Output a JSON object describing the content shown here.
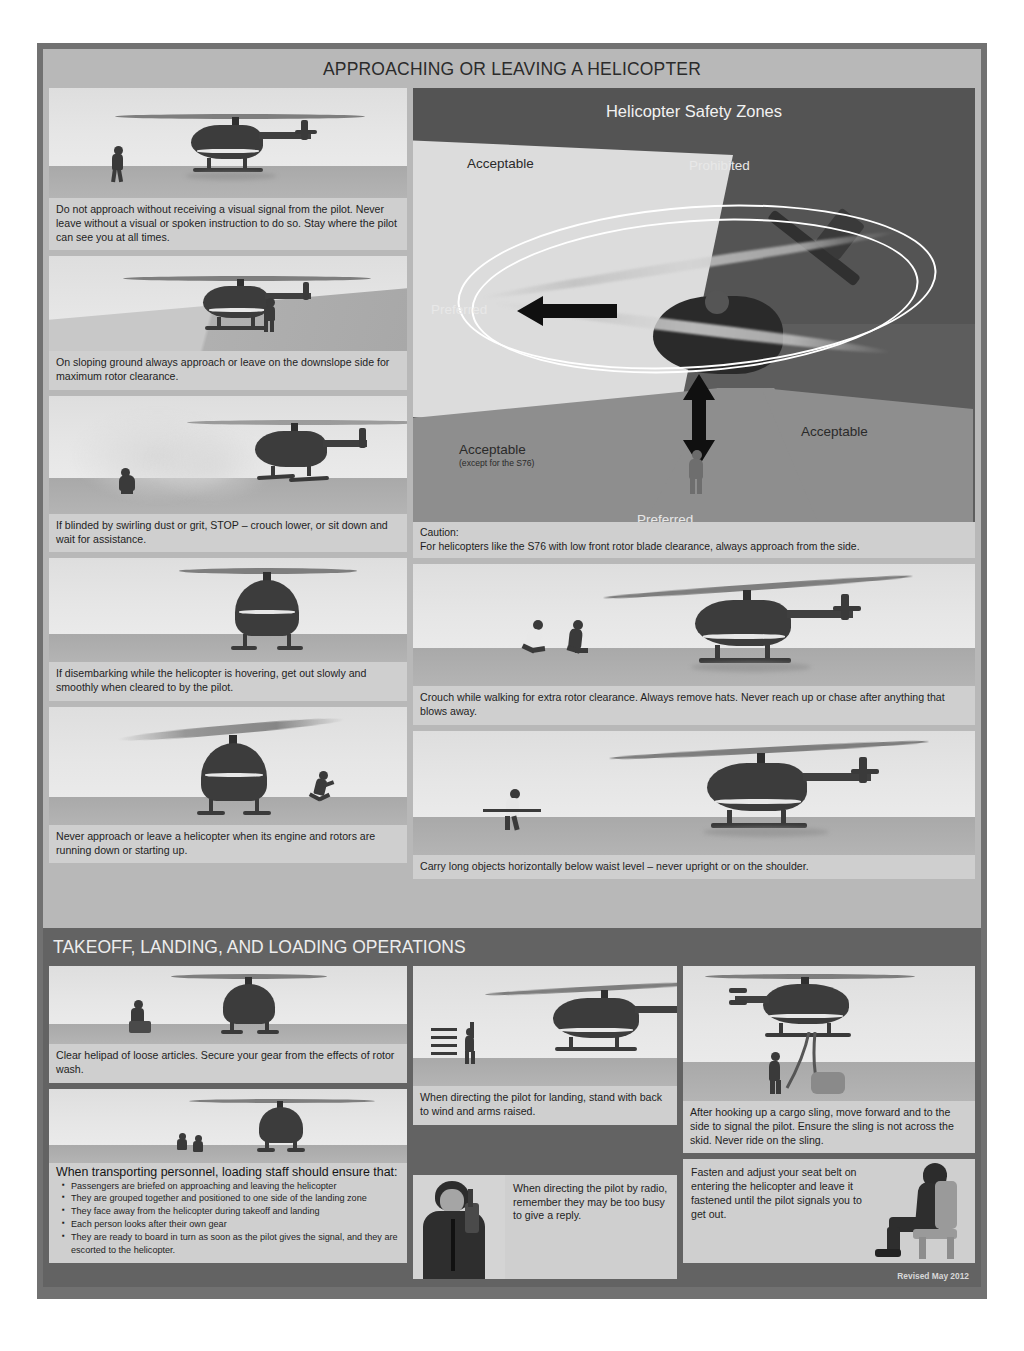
{
  "poster": {
    "revised": "Revised May 2012"
  },
  "section_approach": {
    "title": "APPROACHING OR LEAVING A HELICOPTER",
    "left_panels": [
      {
        "caption": "Do not approach without receiving a visual signal from the pilot. Never leave without a visual or spoken instruction to do so. Stay where the pilot can see you at all times."
      },
      {
        "caption": "On sloping ground always approach or leave on the downslope side for maximum rotor clearance."
      },
      {
        "caption": "If blinded by swirling dust or grit, STOP – crouch lower, or sit down and wait for assistance."
      },
      {
        "caption": "If disembarking while the helicopter is hovering, get out slowly and smoothly when cleared to by the pilot."
      },
      {
        "caption": "Never approach or leave a helicopter when its engine and rotors are running down or starting up."
      }
    ],
    "right_panels": [
      {
        "caption": "Crouch while walking for extra rotor clearance. Always remove hats. Never reach up or chase after anything that blows away."
      },
      {
        "caption": "Carry long objects horizontally below waist level – never upright or on the shoulder."
      }
    ]
  },
  "safety_zones": {
    "title": "Helicopter Safety Zones",
    "labels": {
      "acceptable_top_left": "Acceptable",
      "prohibited": "Prohibited",
      "preferred_left": "Preferred",
      "acceptable_bottom_left": "Acceptable",
      "acceptable_bottom_left_sub": "(except for the S76)",
      "acceptable_right": "Acceptable",
      "preferred_bottom": "Preferred"
    },
    "caution_label": "Caution:",
    "caution_text": "For helicopters like the S76 with low front rotor blade clearance, always approach from the side."
  },
  "section_takeoff": {
    "title": "TAKEOFF, LANDING, AND LOADING OPERATIONS",
    "panel_helipad": {
      "caption": "Clear helipad of loose articles. Secure your gear from the effects of rotor wash."
    },
    "panel_loading": {
      "heading": "When transporting personnel, loading staff should ensure that:",
      "bullets": [
        "Passengers are briefed on approaching and leaving the helicopter",
        "They are grouped together and positioned to one side of the landing zone",
        "They face away from the helicopter during takeoff and landing",
        "Each person looks after their own gear",
        "They are ready to board in turn as soon as the pilot gives the signal, and they are escorted to the helicopter."
      ]
    },
    "panel_directing": {
      "caption": "When directing the pilot for landing, stand with back to wind and arms raised."
    },
    "panel_radio": {
      "caption": "When directing the pilot by radio, remember they may be too busy to give a reply."
    },
    "panel_sling": {
      "caption": "After hooking up a cargo sling, move forward and to the side to signal the pilot. Ensure the sling is not across the skid. Never ride on the sling."
    },
    "panel_seatbelt": {
      "caption": "Fasten and adjust your seat belt on entering the helicopter and leave it fastened until the pilot signals you to get out."
    }
  }
}
